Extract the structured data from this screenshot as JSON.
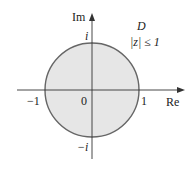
{
  "diagram": {
    "region_name": "D",
    "region_condition": "|z| ≤ 1",
    "axes": {
      "horizontal_label": "Re",
      "vertical_label": "Im"
    },
    "tick_labels": {
      "origin": "0",
      "re_pos": "1",
      "re_neg": "−1",
      "im_pos": "i",
      "im_neg": "−i"
    },
    "colors": {
      "disk_fill": "#e6e6e6",
      "circle_stroke": "#666666",
      "axis": "#333333"
    }
  }
}
